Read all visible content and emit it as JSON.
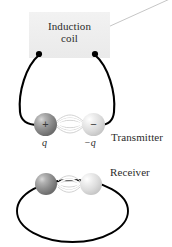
{
  "figure": {
    "name": "electromagnetic-dipole-transmitter-receiver",
    "background_color": "#ffffff"
  },
  "coil_box": {
    "label_line1": "Induction",
    "label_line2": "coil",
    "fill_color": "#eeeeee"
  },
  "labels": {
    "transmitter": "Transmitter",
    "receiver": "Receiver"
  },
  "transmitter": {
    "positive_sphere": {
      "sign": "+",
      "charge_label": "q",
      "color": "#8e8e8e"
    },
    "negative_sphere": {
      "sign": "−",
      "charge_label": "−q",
      "color": "#dcdcdc"
    },
    "wire_color": "#000000",
    "terminal_color": "#000000"
  },
  "receiver": {
    "left_sphere": {
      "color": "#8e8e8e"
    },
    "right_sphere": {
      "color": "#dcdcdc"
    },
    "loop_color": "#000000"
  },
  "leader_line": {
    "color": "#c8c8c8"
  },
  "field_lines": {
    "color": "#d5d5d5"
  }
}
